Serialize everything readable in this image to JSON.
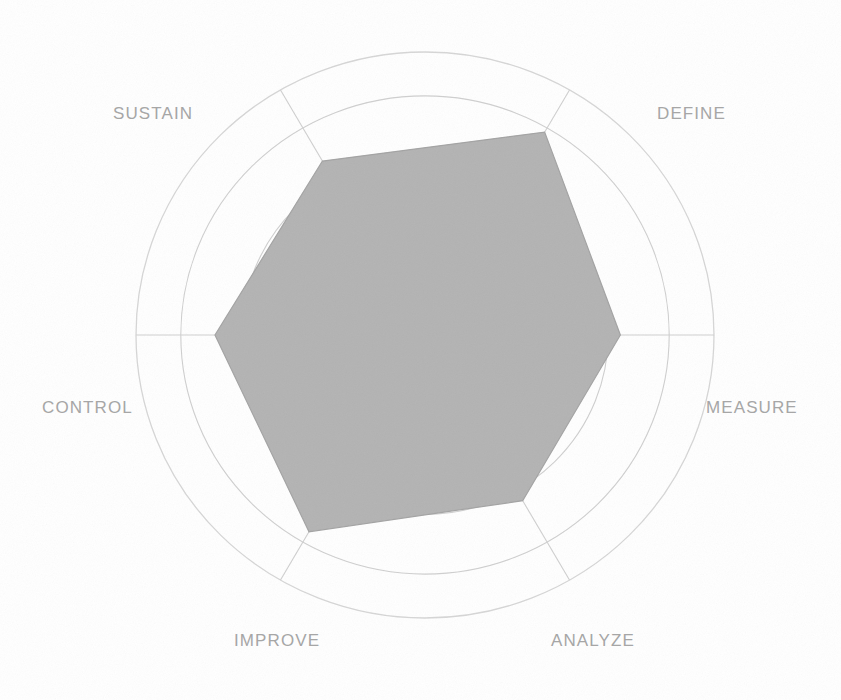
{
  "chart_data": {
    "type": "radar",
    "title": "",
    "subtitle": "",
    "xlabel": "",
    "ylabel": "",
    "legend": [],
    "grid": true,
    "rings": 5,
    "scale_max": 5,
    "axis_start_angle_deg": 90,
    "categories": [
      "DEFINE",
      "MEASURE",
      "ANALYZE",
      "IMPROVE",
      "CONTROL",
      "SUSTAIN"
    ],
    "values": [
      4.2,
      4.9,
      4.0,
      4.0,
      4.75,
      4.3
    ],
    "series": [
      {
        "name": "Maturity",
        "values": [
          4.2,
          4.9,
          4.0,
          4.0,
          4.75,
          4.3
        ],
        "fill_color": "#b3b3b3",
        "line_color": "#a3a3a3"
      }
    ],
    "colors": {
      "fill": "#b3b3b3",
      "stroke": "#a3a3a3",
      "grid": "#cfcfcf",
      "spoke": "#cfcfcf",
      "outer_ring": "#d4d4d4",
      "label": "#a6a6a6",
      "background": "#ffffff"
    },
    "tick_labels": [],
    "annotations": []
  },
  "labels": {
    "define": "DEFINE",
    "measure": "MEASURE",
    "analyze": "ANALYZE",
    "improve": "IMPROVE",
    "control": "CONTROL",
    "sustain": "SUSTAIN"
  }
}
